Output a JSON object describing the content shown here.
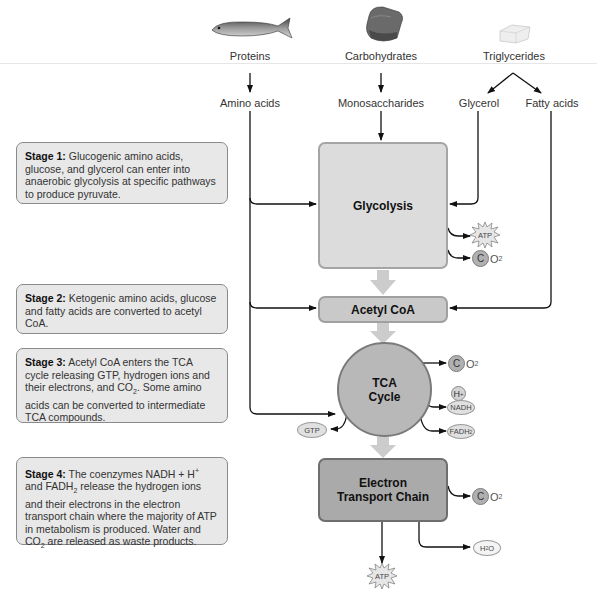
{
  "sources": [
    {
      "id": "proteins",
      "label": "Proteins",
      "icon": "fish-icon"
    },
    {
      "id": "carbohydrates",
      "label": "Carbohydrates",
      "icon": "bread-icon"
    },
    {
      "id": "triglycerides",
      "label": "Triglycerides",
      "icon": "butter-icon"
    }
  ],
  "intermediates": {
    "amino_acids": "Amino acids",
    "monosaccharides": "Monosaccharides",
    "glycerol": "Glycerol",
    "fatty_acids": "Fatty acids"
  },
  "stages": [
    {
      "title": "Stage 1:",
      "text": " Glucogenic amino acids, glucose, and glycerol can enter into anaerobic glycolysis at specific pathways to produce pyruvate."
    },
    {
      "title": "Stage 2:",
      "text": " Ketogenic amino acids, glucose and fatty acids are converted to acetyl CoA."
    },
    {
      "title": "Stage 3:",
      "text_a": " Acetyl CoA enters the TCA cycle releasing GTP, hydrogen ions and their electrons, and CO",
      "text_sub": "2",
      "text_b": ". Some amino acids can be converted to intermediate TCA compounds."
    },
    {
      "title": "Stage 4:",
      "text_a": " The coenzymes NADH + H",
      "text_sup": "+",
      "text_b": " and FADH",
      "text_sub": "2",
      "text_c": " release the hydrogen ions and their electrons in the electron transport chain where the majority of ATP in metabolism is produced. Water and CO",
      "text_sub2": "2",
      "text_d": " are released as waste products."
    }
  ],
  "pathway": {
    "glycolysis": "Glycolysis",
    "acetyl_coa": "Acetyl CoA",
    "tca_line1": "TCA",
    "tca_line2": "Cycle",
    "etc_line1": "Electron",
    "etc_line2": "Transport Chain"
  },
  "products": {
    "atp": "ATP",
    "c": "C",
    "o": "O",
    "sub2": "2",
    "gtp": "GTP",
    "h": "H",
    "plus": "+",
    "nadh": "NADH",
    "fadh": "FADH",
    "h2o_h": "H",
    "h2o_o": "O"
  },
  "colors": {
    "glycolysis_fill": "#dcdcdc",
    "acetyl_fill": "#c9c9c9",
    "tca_fill": "#b8b8b8",
    "etc_fill": "#aaaaaa",
    "flow_arrow": "#cccccc",
    "line": "#111111"
  }
}
